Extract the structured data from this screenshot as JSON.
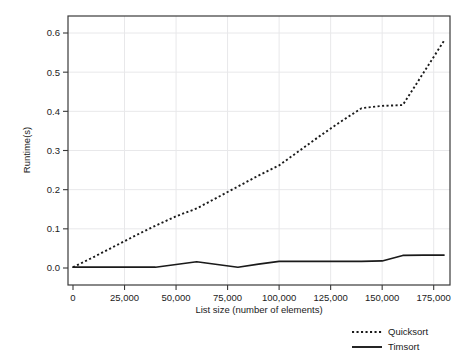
{
  "chart_data": {
    "type": "line",
    "title": "",
    "xlabel": "List size (number of elements)",
    "ylabel": "Runtime(s)",
    "xlim": [
      0,
      180000
    ],
    "ylim": [
      0.0,
      0.63
    ],
    "grid": true,
    "legend_position": "bottom-right",
    "xticks": [
      0,
      25000,
      50000,
      75000,
      100000,
      125000,
      150000,
      175000
    ],
    "xtick_labels": [
      "0",
      "25,000",
      "50,000",
      "75,000",
      "100,000",
      "125,000",
      "150,000",
      "175,000"
    ],
    "yticks": [
      0.0,
      0.1,
      0.2,
      0.3,
      0.4,
      0.5,
      0.6
    ],
    "ytick_labels": [
      "0.0",
      "0.1",
      "0.2",
      "0.3",
      "0.4",
      "0.5",
      "0.6"
    ],
    "x": [
      0,
      10000,
      20000,
      30000,
      40000,
      50000,
      60000,
      70000,
      80000,
      90000,
      100000,
      110000,
      120000,
      130000,
      140000,
      150000,
      160000,
      170000,
      180000
    ],
    "series": [
      {
        "name": "Quicksort",
        "style": "dotted",
        "color": "#1a1a1a",
        "values": [
          0.002,
          0.028,
          0.055,
          0.082,
          0.108,
          0.132,
          0.152,
          0.18,
          0.208,
          0.236,
          0.262,
          0.3,
          0.338,
          0.374,
          0.408,
          0.414,
          0.416,
          0.498,
          0.58
        ]
      },
      {
        "name": "Timsort",
        "style": "solid",
        "color": "#1a1a1a",
        "values": [
          0.002,
          0.002,
          0.002,
          0.002,
          0.002,
          0.009,
          0.016,
          0.009,
          0.002,
          0.01,
          0.017,
          0.017,
          0.017,
          0.017,
          0.017,
          0.018,
          0.032,
          0.033,
          0.033
        ]
      }
    ]
  },
  "legend": {
    "items": [
      {
        "label": "Quicksort",
        "style": "dotted"
      },
      {
        "label": "Timsort",
        "style": "solid"
      }
    ]
  },
  "colors": {
    "line": "#1a1a1a",
    "grid": "#e8e8ea",
    "axis": "#3a3a3a",
    "background": "#ffffff"
  }
}
